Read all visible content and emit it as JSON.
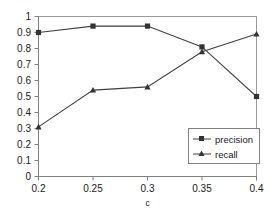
{
  "chart_data": {
    "type": "line",
    "title": "",
    "xlabel": "c",
    "ylabel": "",
    "x": [
      0.2,
      0.25,
      0.3,
      0.35,
      0.4
    ],
    "xtick_labels": [
      "0.2",
      "0.25",
      "0.3",
      "0.35",
      "0.4"
    ],
    "ytick_labels": [
      "0",
      "0.1",
      "0.2",
      "0.3",
      "0.4",
      "0.5",
      "0.6",
      "0.7",
      "0.8",
      "0.9",
      "1"
    ],
    "ylim": [
      0,
      1
    ],
    "xlim": [
      0.2,
      0.4
    ],
    "grid": false,
    "legend_position": "lower right",
    "series": [
      {
        "name": "precision",
        "marker": "square",
        "color": "#404040",
        "values": [
          0.9,
          0.94,
          0.94,
          0.81,
          0.5
        ]
      },
      {
        "name": "recall",
        "marker": "triangle",
        "color": "#404040",
        "values": [
          0.31,
          0.54,
          0.56,
          0.78,
          0.89
        ]
      }
    ]
  },
  "axes": {
    "x_title": "c",
    "y_ticks": [
      "1",
      "0.9",
      "0.8",
      "0.7",
      "0.6",
      "0.5",
      "0.4",
      "0.3",
      "0.2",
      "0.1",
      "0"
    ],
    "x_ticks": [
      "0.2",
      "0.25",
      "0.3",
      "0.35",
      "0.4"
    ]
  },
  "legend": {
    "entries": [
      {
        "label": "precision",
        "marker": "square-marker-icon"
      },
      {
        "label": "recall",
        "marker": "triangle-marker-icon"
      }
    ]
  }
}
